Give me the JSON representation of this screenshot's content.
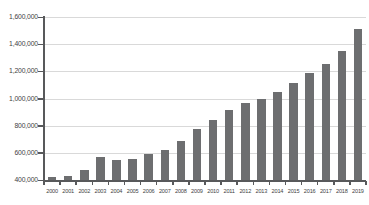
{
  "chart_data": {
    "type": "bar",
    "title": "",
    "subtitle": "",
    "xlabel": "",
    "ylabel": "",
    "grid": true,
    "legend": false,
    "bar_color": "#6d6e70",
    "axis_color": "#58595b",
    "grid_color": "#d9d9d9",
    "ylim": [
      400000,
      1600000
    ],
    "ytick_step": 200000,
    "ytick_labels": [
      "1,600,000",
      "1,400,000",
      "1,200,000",
      "1,000,000",
      "800,000",
      "600,000",
      "400,000"
    ],
    "ytick_values": [
      1600000,
      1400000,
      1200000,
      1000000,
      800000,
      600000,
      400000
    ],
    "categories": [
      "2000",
      "2001",
      "2002",
      "2003",
      "2004",
      "2005",
      "2006",
      "2007",
      "2008",
      "2009",
      "2010",
      "2011",
      "2012",
      "2013",
      "2014",
      "2015",
      "2016",
      "2017",
      "2018",
      "2019"
    ],
    "values": [
      420000,
      432000,
      470000,
      570000,
      550000,
      556000,
      590000,
      620000,
      690000,
      772000,
      845000,
      915000,
      965000,
      995000,
      1045000,
      1115000,
      1190000,
      1255000,
      1350000,
      1515000
    ]
  }
}
